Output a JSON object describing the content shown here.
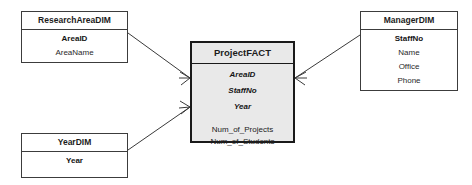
{
  "diagram": {
    "type": "star-schema-er-diagram",
    "fill_fact": "#e9e9e9",
    "fill_dim": "#ffffff",
    "stroke": "#3c3c3c",
    "stroke_fact": "#1a1a1a"
  },
  "entities": {
    "research_area": {
      "title": "ResearchAreaDIM",
      "attributes": [
        {
          "label": "AreaID",
          "role": "key"
        },
        {
          "label": "AreaName",
          "role": "plain"
        }
      ]
    },
    "year": {
      "title": "YearDIM",
      "attributes": [
        {
          "label": "Year",
          "role": "key"
        }
      ]
    },
    "manager": {
      "title": "ManagerDIM",
      "attributes": [
        {
          "label": "StaffNo",
          "role": "key"
        },
        {
          "label": "Name",
          "role": "plain"
        },
        {
          "label": "Office",
          "role": "plain"
        },
        {
          "label": "Phone",
          "role": "plain"
        }
      ]
    },
    "project_fact": {
      "title": "ProjectFACT",
      "foreign_keys": [
        {
          "label": "AreaID"
        },
        {
          "label": "StaffNo"
        },
        {
          "label": "Year"
        }
      ],
      "measures": [
        {
          "label": "Num_of_Projects"
        },
        {
          "label": "Num_of_Students"
        }
      ]
    }
  },
  "relationships": [
    {
      "name": "researcharea-to-fact",
      "from": "ResearchAreaDIM",
      "to": "ProjectFACT",
      "notation": "crows-foot",
      "x1": 128,
      "y1": 33,
      "x2": 190,
      "y2": 78
    },
    {
      "name": "year-to-fact",
      "from": "YearDIM",
      "to": "ProjectFACT",
      "notation": "crows-foot",
      "x1": 128,
      "y1": 150,
      "x2": 190,
      "y2": 107
    },
    {
      "name": "manager-to-fact",
      "from": "ManagerDIM",
      "to": "ProjectFACT",
      "notation": "crows-foot",
      "x1": 360,
      "y1": 35,
      "x2": 295,
      "y2": 78
    }
  ]
}
